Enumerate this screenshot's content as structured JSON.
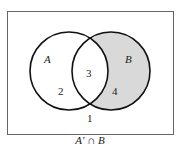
{
  "diagram": {
    "type": "venn",
    "universe_label": "",
    "sets": [
      {
        "name": "A",
        "label": "A"
      },
      {
        "name": "B",
        "label": "B"
      }
    ],
    "regions": [
      {
        "id": "1",
        "label": "1",
        "description": "outside A and B",
        "shaded": false
      },
      {
        "id": "2",
        "label": "2",
        "description": "A only",
        "shaded": false
      },
      {
        "id": "3",
        "label": "3",
        "description": "A and B",
        "shaded": false
      },
      {
        "id": "4",
        "label": "4",
        "description": "B only",
        "shaded": true
      }
    ],
    "caption": "A′ ∩ B",
    "colors": {
      "shade": "#d9d9d9",
      "stroke": "#111111",
      "border": "#666666"
    }
  }
}
